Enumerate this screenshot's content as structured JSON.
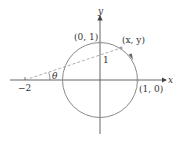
{
  "diagram": {
    "type": "unit-circle-stereographic",
    "colors": {
      "axis": "#444444",
      "circle": "#8a8a8a",
      "dashed": "#9a9a9a",
      "point": "#a0a0a0",
      "text": "#333333"
    },
    "axes": {
      "x_label": "x",
      "y_label": "y"
    },
    "labels": {
      "top_point": "(0, 1)",
      "moving_point": "(x, y)",
      "right_point": "(1, 0)",
      "left_tick": "−2",
      "y_intercept": "1",
      "angle": "θ"
    }
  }
}
